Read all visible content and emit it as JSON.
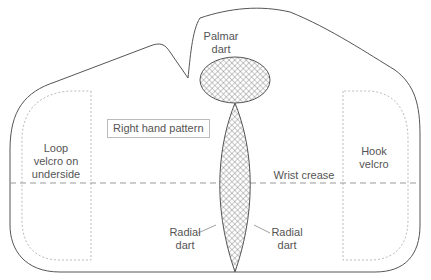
{
  "diagram": {
    "title": "Right hand pattern",
    "labels": {
      "palmar_dart_line1": "Palmar",
      "palmar_dart_line2": "dart",
      "loop_line1": "Loop",
      "loop_line2": "velcro on",
      "loop_line3": "underside",
      "hook_line1": "Hook",
      "hook_line2": "velcro",
      "wrist_crease": "Wrist crease",
      "radial_left_line1": "Radial",
      "radial_left_line2": "dart",
      "radial_right_line1": "Radial",
      "radial_right_line2": "dart"
    },
    "colors": {
      "outline": "#555555",
      "dashed": "#aaaaaa",
      "hatch": "#666666",
      "text": "#555555"
    }
  }
}
